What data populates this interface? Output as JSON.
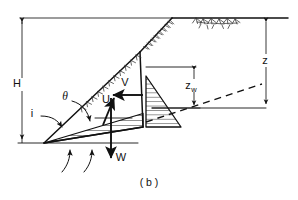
{
  "figure": {
    "caption": "( b )",
    "type": "slope-stability-free-body-diagram",
    "labels": {
      "height": "H",
      "slope_angle": "i",
      "failure_plane_angle": "θ",
      "uplift_force": "U",
      "water_thrust": "V",
      "weight": "W",
      "tension_crack_water_depth": "z",
      "tension_crack_water_depth_sub": "w",
      "tension_crack_depth": "z"
    },
    "colors": {
      "ink": "#111111",
      "background": "#ffffff",
      "hatch": "#333333"
    },
    "geometry": {
      "crest_x": 172,
      "crest_y": 18,
      "toe_x": 44,
      "toe_y": 143,
      "crack_top_x": 140,
      "crack_top_y": 52,
      "crack_base_x": 143,
      "crack_base_y": 127,
      "ground_line_y": 18,
      "base_line_y": 143
    },
    "elements": {
      "slope_face": "inclined-slope-face",
      "failure_surface": "failure-plane",
      "tension_crack": "vertical-tension-crack",
      "uplift_pressure_diagram": "uplift-water-pressure-wedge",
      "crack_pressure_diagram": "tension-crack-water-pressure-triangle",
      "phreatic_line": "dashed-phreatic-surface",
      "ground_surface_hatch": "ground-surface-hatching"
    }
  }
}
